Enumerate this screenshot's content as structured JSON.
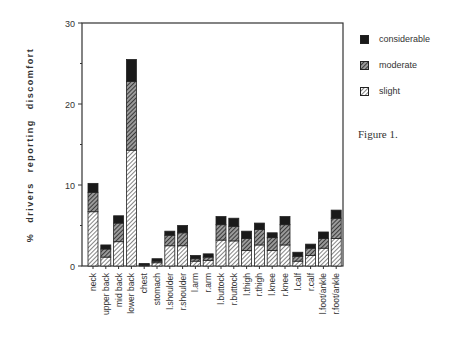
{
  "chart_data": {
    "type": "bar",
    "stacked": true,
    "title": "",
    "caption": "Figure 1.",
    "xlabel": "",
    "ylabel": "% drivers reporting discomfort",
    "ylim": [
      0,
      30
    ],
    "yticks": [
      0,
      10,
      20,
      30
    ],
    "grid": false,
    "legend_position": "right",
    "categories": [
      "neck",
      "upper back",
      "mid back",
      "lower back",
      "chest",
      "stomach",
      "l.shoulder",
      "r.shoulder",
      "l.arm",
      "r.arm",
      "l.buttock",
      "r.buttock",
      "l.thigh",
      "r.thigh",
      "l.knee",
      "r.knee",
      "l.calf",
      "r.calf",
      "l.foot/ankle",
      "r.foot/ankle"
    ],
    "series": [
      {
        "name": "slight",
        "values": [
          6.7,
          1.1,
          3.0,
          14.3,
          0.1,
          0.4,
          2.5,
          2.5,
          0.6,
          0.7,
          3.2,
          3.1,
          1.9,
          2.6,
          1.9,
          2.6,
          0.6,
          1.3,
          2.2,
          3.4
        ]
      },
      {
        "name": "moderate",
        "values": [
          2.4,
          1.0,
          2.3,
          8.5,
          0.1,
          0.2,
          1.3,
          1.6,
          0.3,
          0.4,
          1.9,
          1.8,
          1.5,
          1.9,
          1.6,
          2.5,
          0.6,
          0.9,
          1.2,
          2.5
        ]
      },
      {
        "name": "considerable",
        "values": [
          1.1,
          0.5,
          0.9,
          2.7,
          0.1,
          0.3,
          0.5,
          0.9,
          0.4,
          0.4,
          1.0,
          1.0,
          0.9,
          0.8,
          0.6,
          1.0,
          0.5,
          0.5,
          0.8,
          1.0
        ]
      }
    ],
    "totals": [
      10.2,
      2.6,
      6.2,
      25.5,
      0.3,
      0.9,
      4.3,
      5.0,
      1.3,
      1.5,
      6.1,
      5.9,
      4.3,
      5.3,
      4.1,
      6.1,
      1.7,
      2.7,
      4.2,
      6.9
    ]
  },
  "legend": {
    "items": [
      {
        "label": "considerable",
        "pattern": "solid"
      },
      {
        "label": "moderate",
        "pattern": "dense-hatch"
      },
      {
        "label": "slight",
        "pattern": "light-hatch"
      }
    ]
  },
  "figure": {
    "caption": "Figure 1."
  },
  "axis": {
    "ylabel": "% drivers reporting discomfort"
  },
  "colors": {
    "considerable": "#1a1a1a",
    "moderate": "#555555",
    "slight": "#ffffff",
    "axis": "#333333"
  }
}
